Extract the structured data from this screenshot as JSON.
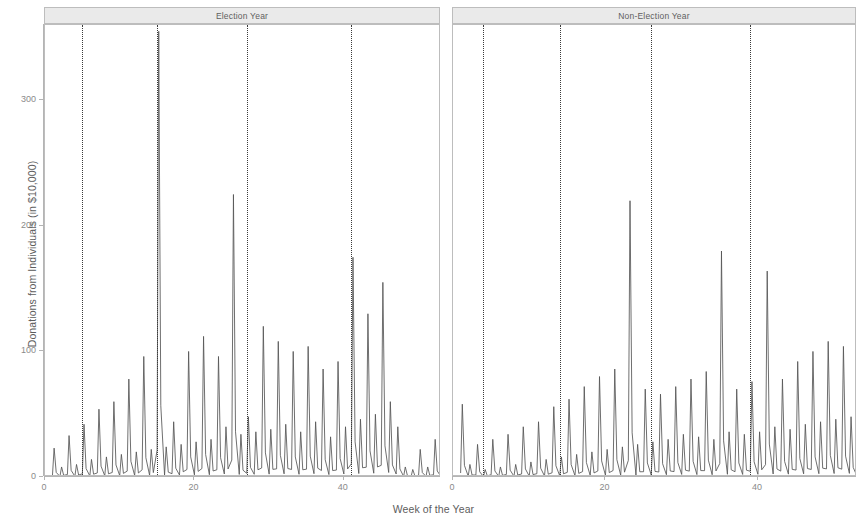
{
  "figure": {
    "xlabel": "Week of the Year",
    "ylabel": "Donations from Individuals (in $10,000)",
    "panels": [
      {
        "id": "election",
        "strip_label": "Election Year"
      },
      {
        "id": "nonelection",
        "strip_label": "Non-Election Year"
      }
    ]
  },
  "axes": {
    "y_ticks": [
      "0",
      "100",
      "200",
      "300"
    ],
    "x_ticks": [
      "0",
      "20",
      "40"
    ],
    "y_range": [
      0,
      360
    ],
    "x_range": [
      0,
      53
    ]
  },
  "chart_data": {
    "type": "line",
    "title": "",
    "xlabel": "Week of the Year",
    "ylabel": "Donations from Individuals (in $10,000)",
    "xlim": [
      0,
      53
    ],
    "ylim": [
      0,
      360
    ],
    "grid": false,
    "legend": null,
    "facets": [
      "Election Year",
      "Non-Election Year"
    ],
    "reference_lines": {
      "style": "dotted",
      "color": "#3a3a3a",
      "election_year_weeks": [
        5,
        15,
        27,
        41
      ],
      "non_election_year_weeks": [
        4,
        14,
        26,
        39
      ]
    },
    "series": [
      {
        "name": "Election Year",
        "facet": "Election Year",
        "x": [
          1,
          2,
          3,
          4,
          5,
          6,
          7,
          8,
          9,
          10,
          11,
          12,
          13,
          14,
          15,
          16,
          17,
          18,
          19,
          20,
          21,
          22,
          23,
          24,
          25,
          26,
          27,
          28,
          29,
          30,
          31,
          32,
          33,
          34,
          35,
          36,
          37,
          38,
          39,
          40,
          41,
          42,
          43,
          44,
          45,
          46,
          47,
          48,
          49,
          50,
          51,
          52,
          53
        ],
        "values": [
          23,
          8,
          33,
          10,
          42,
          14,
          54,
          16,
          60,
          18,
          78,
          20,
          96,
          22,
          355,
          24,
          44,
          26,
          100,
          28,
          112,
          30,
          96,
          40,
          225,
          34,
          48,
          36,
          120,
          38,
          108,
          42,
          100,
          36,
          104,
          44,
          86,
          32,
          92,
          40,
          175,
          46,
          130,
          50,
          155,
          60,
          40,
          8,
          6,
          22,
          8,
          30,
          6
        ]
      },
      {
        "name": "Non-Election Year",
        "facet": "Non-Election Year",
        "x": [
          1,
          2,
          3,
          4,
          5,
          6,
          7,
          8,
          9,
          10,
          11,
          12,
          13,
          14,
          15,
          16,
          17,
          18,
          19,
          20,
          21,
          22,
          23,
          24,
          25,
          26,
          27,
          28,
          29,
          30,
          31,
          32,
          33,
          34,
          35,
          36,
          37,
          38,
          39,
          40,
          41,
          42,
          43,
          44,
          45,
          46,
          47,
          48,
          49,
          50,
          51,
          52,
          53
        ],
        "values": [
          58,
          10,
          26,
          6,
          30,
          8,
          34,
          10,
          40,
          12,
          44,
          14,
          56,
          16,
          62,
          18,
          72,
          20,
          80,
          22,
          86,
          24,
          220,
          26,
          70,
          28,
          66,
          30,
          72,
          34,
          78,
          32,
          84,
          30,
          180,
          36,
          70,
          34,
          76,
          36,
          164,
          40,
          78,
          38,
          92,
          42,
          100,
          44,
          108,
          46,
          104,
          48,
          10
        ]
      }
    ]
  }
}
